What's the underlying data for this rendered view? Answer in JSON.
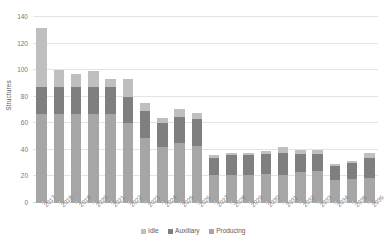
{
  "chart_data": {
    "type": "bar",
    "stacked": true,
    "title": "",
    "xlabel": "",
    "ylabel": "Structures",
    "ylim": [
      0,
      140
    ],
    "ytick_step": 20,
    "yticks": [
      0,
      20,
      40,
      60,
      80,
      100,
      120,
      140
    ],
    "grid": true,
    "legend_position": "bottom-center",
    "categories": [
      "2017",
      "2018",
      "2019",
      "2020",
      "2021",
      "2022",
      "2023",
      "2024",
      "2025",
      "2026",
      "2027",
      "2028",
      "2029",
      "2030",
      "2031",
      "2032",
      "2033",
      "2034",
      "2035",
      "2036"
    ],
    "series": [
      {
        "name": "Producing",
        "color": "#a6a6a6",
        "values": [
          67,
          67,
          67,
          67,
          67,
          60,
          49,
          42,
          45,
          43,
          21,
          21,
          21,
          22,
          21,
          23,
          24,
          17,
          18,
          19
        ]
      },
      {
        "name": "Auxiliary",
        "color": "#7f7f7f",
        "values": [
          20,
          20,
          20,
          20,
          20,
          20,
          20,
          18,
          20,
          20,
          13,
          15,
          15,
          15,
          17,
          14,
          13,
          11,
          12,
          15
        ]
      },
      {
        "name": "Idle",
        "color": "#bfbfbf",
        "values": [
          45,
          13,
          10,
          12,
          6,
          13,
          6,
          4,
          6,
          5,
          2,
          2,
          2,
          2,
          4,
          3,
          3,
          1,
          2,
          4
        ]
      }
    ],
    "totals": [
      132,
      100,
      97,
      99,
      93,
      93,
      75,
      64,
      71,
      68,
      36,
      38,
      38,
      39,
      42,
      40,
      40,
      29,
      32,
      38
    ],
    "legend_order": [
      "Idle",
      "Auxiliary",
      "Producing"
    ]
  },
  "axis": {
    "y_title": "Structures"
  },
  "colors": {
    "gridline": "#e4e4e4",
    "axis_text": "#7a7a7a",
    "legend_text": "#595959",
    "background": "#ffffff"
  }
}
